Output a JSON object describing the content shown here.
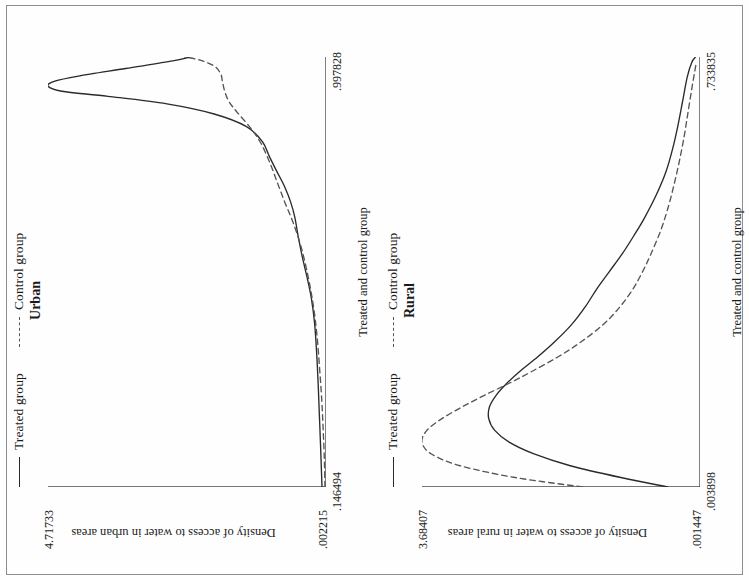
{
  "figure": {
    "border_color": "#8d8d8d",
    "background": "#fefefe"
  },
  "chart_data": [
    {
      "type": "line",
      "title": "Urban",
      "xlabel": "Treated and control group",
      "ylabel": "Density of access to water in urban areas",
      "xlim": [
        0.146494,
        0.997828
      ],
      "ylim": [
        0.002215,
        4.71733
      ],
      "xticks": [
        0.146494,
        0.359327,
        0.572161,
        0.784994,
        0.997828
      ],
      "xticklabels": [
        ".146494",
        "",
        "",
        "",
        ".997828"
      ],
      "yticks": [
        0.002215,
        1.181494,
        2.360773,
        3.540051,
        4.71733
      ],
      "yticklabels": [
        ".002215",
        "",
        "",
        "",
        "4.71733"
      ],
      "grid": false,
      "legend_position": "top",
      "series": [
        {
          "name": "Treated group",
          "style": "solid",
          "color": "#2a2a2a",
          "x": [
            0.147,
            0.18,
            0.23,
            0.29,
            0.35,
            0.41,
            0.47,
            0.52,
            0.56,
            0.6,
            0.64,
            0.68,
            0.71,
            0.74,
            0.77,
            0.8,
            0.83,
            0.86,
            0.885,
            0.905,
            0.92,
            0.93,
            0.94,
            0.95,
            0.96,
            0.975,
            0.99,
            0.998
          ],
          "y": [
            0.07,
            0.08,
            0.095,
            0.115,
            0.135,
            0.16,
            0.195,
            0.25,
            0.32,
            0.4,
            0.47,
            0.53,
            0.6,
            0.7,
            0.83,
            0.96,
            1.08,
            1.35,
            1.9,
            2.7,
            3.7,
            4.48,
            4.717,
            4.6,
            4.2,
            3.4,
            2.6,
            2.3
          ]
        },
        {
          "name": "Control group",
          "style": "dashed",
          "color": "#555555",
          "x": [
            0.147,
            0.2,
            0.26,
            0.32,
            0.38,
            0.44,
            0.5,
            0.56,
            0.62,
            0.67,
            0.71,
            0.75,
            0.79,
            0.83,
            0.86,
            0.89,
            0.91,
            0.93,
            0.95,
            0.965,
            0.98,
            0.992,
            0.998
          ],
          "y": [
            0.02,
            0.03,
            0.05,
            0.075,
            0.11,
            0.15,
            0.21,
            0.3,
            0.42,
            0.56,
            0.7,
            0.83,
            0.96,
            1.12,
            1.3,
            1.52,
            1.65,
            1.72,
            1.76,
            1.79,
            1.9,
            2.15,
            2.4
          ]
        }
      ]
    },
    {
      "type": "line",
      "title": "Rural",
      "xlabel": "Treated and control group",
      "ylabel": "Density of access to water in rural areas",
      "xlim": [
        0.003898,
        0.733835
      ],
      "ylim": [
        0.001447,
        3.68407
      ],
      "xticks": [
        0.003898,
        0.186382,
        0.368867,
        0.551351,
        0.733835
      ],
      "xticklabels": [
        ".003898",
        "",
        "",
        "",
        ".733835"
      ],
      "yticks": [
        0.001447,
        0.922103,
        1.842759,
        2.763414,
        3.68407
      ],
      "yticklabels": [
        ".001447",
        "",
        "",
        "",
        "3.68407"
      ],
      "grid": false,
      "legend_position": "top",
      "series": [
        {
          "name": "Treated group",
          "style": "solid",
          "color": "#2a2a2a",
          "x": [
            0.004,
            0.02,
            0.04,
            0.06,
            0.08,
            0.1,
            0.12,
            0.14,
            0.16,
            0.18,
            0.2,
            0.225,
            0.25,
            0.28,
            0.31,
            0.34,
            0.37,
            0.4,
            0.43,
            0.46,
            0.5,
            0.54,
            0.58,
            0.62,
            0.66,
            0.7,
            0.725,
            0.734
          ],
          "y": [
            0.43,
            1.05,
            1.72,
            2.2,
            2.53,
            2.72,
            2.8,
            2.79,
            2.7,
            2.56,
            2.39,
            2.15,
            1.93,
            1.7,
            1.52,
            1.37,
            1.2,
            1.03,
            0.88,
            0.74,
            0.58,
            0.45,
            0.36,
            0.29,
            0.23,
            0.17,
            0.11,
            0.06
          ]
        },
        {
          "name": "Control group",
          "style": "dashed",
          "color": "#555555",
          "x": [
            0.004,
            0.02,
            0.04,
            0.06,
            0.08,
            0.1,
            0.12,
            0.14,
            0.16,
            0.18,
            0.2,
            0.225,
            0.25,
            0.28,
            0.31,
            0.34,
            0.37,
            0.4,
            0.44,
            0.48,
            0.52,
            0.56,
            0.6,
            0.64,
            0.68,
            0.71,
            0.725
          ],
          "y": [
            1.56,
            2.45,
            3.18,
            3.56,
            3.684,
            3.62,
            3.42,
            3.15,
            2.85,
            2.53,
            2.23,
            1.88,
            1.58,
            1.28,
            1.06,
            0.89,
            0.76,
            0.65,
            0.52,
            0.42,
            0.34,
            0.27,
            0.21,
            0.16,
            0.11,
            0.07,
            0.05
          ]
        }
      ]
    }
  ],
  "panels": {
    "urban": {
      "title": "Urban",
      "legend": {
        "treated": "Treated group",
        "control": "Control group"
      },
      "xlabel": "Treated and control group",
      "ylabel": "Density of access to water in urban areas",
      "ytick_high": "4.71733",
      "ytick_low": ".002215",
      "xtick_low": ".146494",
      "xtick_high": ".997828"
    },
    "rural": {
      "title": "Rural",
      "legend": {
        "treated": "Treated group",
        "control": "Control group"
      },
      "xlabel": "Treated and control group",
      "ylabel": "Density of access to water in rural areas",
      "ytick_high": "3.68407",
      "ytick_low": ".001447",
      "xtick_low": ".003898",
      "xtick_high": ".733835"
    }
  }
}
